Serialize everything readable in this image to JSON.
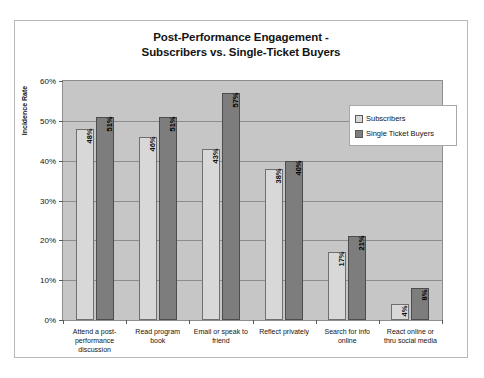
{
  "chart_data": {
    "type": "bar",
    "title": "Post-Performance Engagement - Subscribers vs. Single-Ticket Buyers",
    "title_lines": [
      "Post-Performance Engagement -",
      "Subscribers vs. Single-Ticket Buyers"
    ],
    "xlabel": "",
    "ylabel": "Incidence Rate",
    "ylim": [
      0,
      60
    ],
    "ytick_labels": [
      "0%",
      "10%",
      "20%",
      "30%",
      "40%",
      "50%",
      "60%"
    ],
    "ytick_values": [
      0,
      10,
      20,
      30,
      40,
      50,
      60
    ],
    "grid": true,
    "legend_position": "inside-top-right",
    "categories": [
      "Attend a post-performance discussion",
      "Read program book",
      "Email or speak to friend",
      "Reflect privately",
      "Search for info online",
      "React online or thru social media"
    ],
    "category_lines": [
      [
        "Attend a post-",
        "performance",
        "discussion"
      ],
      [
        "Read program",
        "book"
      ],
      [
        "Email or speak to",
        "friend"
      ],
      [
        "Reflect privately"
      ],
      [
        "Search for info",
        "online"
      ],
      [
        "React online or",
        "thru social media"
      ]
    ],
    "series": [
      {
        "name": "Subscribers",
        "color": "#d8d8d8",
        "values": [
          48,
          46,
          43,
          38,
          17,
          4
        ],
        "labels": [
          "48%",
          "46%",
          "43%",
          "38%",
          "17%",
          "4%"
        ]
      },
      {
        "name": "Single Ticket Buyers",
        "color": "#7d7d7d",
        "values": [
          51,
          51,
          57,
          40,
          21,
          8
        ],
        "labels": [
          "51%",
          "51%",
          "57%",
          "40%",
          "21%",
          "8%"
        ]
      }
    ]
  },
  "legend": {
    "items": [
      {
        "label": "Subscribers"
      },
      {
        "label": "Single Ticket Buyers"
      }
    ]
  }
}
